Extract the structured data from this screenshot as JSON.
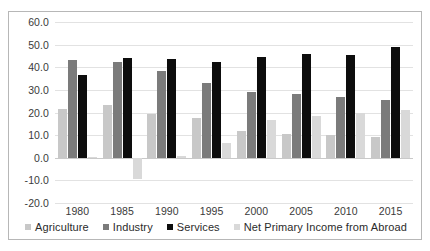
{
  "chart_data": {
    "type": "bar",
    "title": "",
    "subtitle": "",
    "xlabel": "",
    "ylabel": "",
    "categories": [
      "1980",
      "1985",
      "1990",
      "1995",
      "2000",
      "2005",
      "2010",
      "2015"
    ],
    "series": [
      {
        "name": "Agriculture",
        "color": "#c8c8c8",
        "values": [
          21.5,
          23.5,
          19.5,
          17.5,
          12.0,
          10.5,
          10.0,
          9.0
        ]
      },
      {
        "name": "Industry",
        "color": "#7b7b7b",
        "values": [
          43.0,
          42.5,
          38.5,
          33.0,
          29.0,
          28.0,
          27.0,
          25.5
        ]
      },
      {
        "name": "Services",
        "color": "#0d0d0d",
        "values": [
          36.5,
          44.0,
          43.5,
          42.5,
          44.5,
          46.0,
          45.5,
          49.0
        ]
      },
      {
        "name": "Net Primary Income from Abroad",
        "color": "#d9d9d9",
        "values": [
          0.5,
          -9.5,
          0.8,
          6.5,
          16.5,
          18.5,
          20.0,
          21.0
        ]
      }
    ],
    "ylim": [
      -20.0,
      60.0
    ],
    "ytick_labels": [
      "60.0",
      "50.0",
      "40.0",
      "30.0",
      "20.0",
      "10.0",
      "0.0",
      "-10.0",
      "-20.0"
    ],
    "yticks": [
      60,
      50,
      40,
      30,
      20,
      10,
      0,
      -10,
      -20
    ],
    "grid": true,
    "legend_position": "bottom",
    "plot_background": "#ffffff",
    "gridline_color": "#e2e2e2",
    "border_color": "#b7b7b7"
  }
}
